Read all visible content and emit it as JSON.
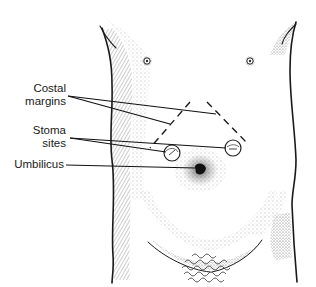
{
  "figure": {
    "labels": [
      {
        "id": "costal",
        "lines": [
          "Costal",
          "margins"
        ]
      },
      {
        "id": "stoma",
        "lines": [
          "Stoma",
          "sites"
        ]
      },
      {
        "id": "umbilicus",
        "lines": [
          "Umbilicus"
        ]
      }
    ],
    "colors": {
      "ink": "#1a1a1a",
      "stipple": "#555555",
      "background": "#ffffff"
    }
  }
}
